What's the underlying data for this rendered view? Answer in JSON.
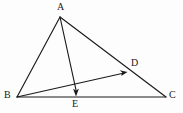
{
  "figure": {
    "type": "geometry-diagram",
    "background_color": "#fdfdfd",
    "stroke_color": "#1a1a1a",
    "label_color": "#1a1a1a",
    "width": 183,
    "height": 113
  },
  "points": {
    "A": {
      "label": "A",
      "x": 60,
      "y": 17,
      "label_x": 57,
      "label_y": 2
    },
    "B": {
      "label": "B",
      "x": 17,
      "y": 97,
      "label_x": 4,
      "label_y": 90
    },
    "C": {
      "label": "C",
      "x": 166,
      "y": 97,
      "label_x": 169,
      "label_y": 90
    },
    "D": {
      "label": "D",
      "x": 127,
      "y": 71,
      "label_x": 131,
      "label_y": 58
    },
    "E": {
      "label": "E",
      "x": 76,
      "y": 96,
      "label_x": 72,
      "label_y": 99
    }
  },
  "segments": [
    {
      "name": "side-AB",
      "from": "A",
      "to": "B",
      "arrow": false
    },
    {
      "name": "side-AC",
      "from": "A",
      "to": "C",
      "arrow": false
    },
    {
      "name": "side-BC",
      "from": "B",
      "to": "C",
      "arrow": false
    },
    {
      "name": "cevian-AE",
      "from": "A",
      "to": "E",
      "arrow": true
    },
    {
      "name": "cevian-BD",
      "from": "B",
      "to": "D",
      "arrow": true
    }
  ],
  "labels": {
    "A": "A",
    "B": "B",
    "C": "C",
    "D": "D",
    "E": "E"
  }
}
